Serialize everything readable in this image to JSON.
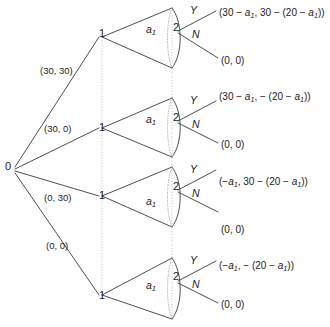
{
  "figure": {
    "background": "#ffffff",
    "line_color": "#3a3a3a",
    "dotted_color": "#9a9a9a",
    "text_color": "#1b1b1b",
    "width": 330,
    "height": 327
  },
  "root": {
    "label": "0",
    "x": 8,
    "y": 168
  },
  "subtrees": [
    {
      "branch_label": "(30, 30)",
      "branch_label_x": 40,
      "branch_label_y": 66,
      "player1_label": "1",
      "player1_x": 101,
      "player1_y": 34,
      "fan_label": "a1",
      "fan_label_x": 150,
      "fan_label_y": 28,
      "player2_label": "2",
      "player2_x": 175,
      "player2_y": 27,
      "action_yes": "Y",
      "action_yes_x": 192,
      "action_yes_y": 8,
      "action_no": "N",
      "action_no_x": 194,
      "action_no_y": 31,
      "payoff_yes": "(30 − a1, 30 − (20 − a1))",
      "payoff_yes_x": 219,
      "payoff_yes_y": 8,
      "payoff_no": "(0, 0)",
      "payoff_no_x": 221,
      "payoff_no_y": 56
    },
    {
      "branch_label": "(30, 0)",
      "branch_label_x": 44,
      "branch_label_y": 124,
      "player1_label": "1",
      "player1_x": 101,
      "player1_y": 125,
      "fan_label": "a1",
      "fan_label_x": 150,
      "fan_label_y": 118,
      "player2_label": "2",
      "player2_x": 175,
      "player2_y": 117,
      "action_yes": "Y",
      "action_yes_x": 192,
      "action_yes_y": 98,
      "action_no": "N",
      "action_no_x": 194,
      "action_no_y": 121,
      "payoff_yes": "(30 − a1, − (20 − a1))",
      "payoff_yes_x": 219,
      "payoff_yes_y": 92,
      "payoff_no": "(0, 0)",
      "payoff_no_x": 221,
      "payoff_no_y": 140
    },
    {
      "branch_label": "(0, 30)",
      "branch_label_x": 44,
      "branch_label_y": 193,
      "player1_label": "1",
      "player1_x": 101,
      "player1_y": 193,
      "fan_label": "a1",
      "fan_label_x": 150,
      "fan_label_y": 200,
      "player2_label": "2",
      "player2_x": 175,
      "player2_y": 186,
      "action_yes": "Y",
      "action_yes_x": 192,
      "action_yes_y": 167,
      "action_no": "N",
      "action_no_x": 194,
      "action_no_y": 190,
      "payoff_yes": "(−a1, 30 − (20 − a1))",
      "payoff_yes_x": 219,
      "payoff_yes_y": 177,
      "payoff_no": "(0, 0)",
      "payoff_no_x": 221,
      "payoff_no_y": 225
    },
    {
      "branch_label": "(0, 0)",
      "branch_label_x": 46,
      "branch_label_y": 241,
      "player1_label": "1",
      "player1_x": 101,
      "player1_y": 292,
      "fan_label": "a1",
      "fan_label_x": 150,
      "fan_label_y": 284,
      "player2_label": "2",
      "player2_x": 175,
      "player2_y": 276,
      "action_yes": "Y",
      "action_yes_x": 192,
      "action_yes_y": 258,
      "action_no": "N",
      "action_no_x": 194,
      "action_no_y": 281,
      "payoff_yes": "(−a1, − (20 − a1))",
      "payoff_yes_x": 219,
      "payoff_yes_y": 261,
      "payoff_no": "(0, 0)",
      "payoff_no_x": 221,
      "payoff_no_y": 300
    }
  ],
  "notation": {
    "action_variable": "a1",
    "player1": "1",
    "player2": "2",
    "root_player": "0",
    "yes": "Y",
    "no": "N"
  }
}
